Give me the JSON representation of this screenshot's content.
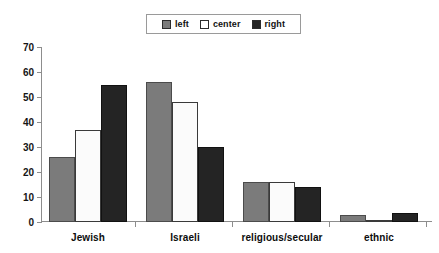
{
  "chart_data": {
    "type": "bar",
    "title": "",
    "xlabel": "",
    "ylabel": "",
    "ylim": [
      0,
      70
    ],
    "ytick_step": 10,
    "yticks": [
      0,
      10,
      20,
      30,
      40,
      50,
      60,
      70
    ],
    "grid": false,
    "legend_position": "top-center",
    "categories": [
      "Jewish",
      "Israeli",
      "religious/secular",
      "ethnic"
    ],
    "series": [
      {
        "name": "left",
        "color": "#7b7b7b",
        "values": [
          26,
          56,
          16,
          3
        ]
      },
      {
        "name": "center",
        "color": "#fbfbfb",
        "values": [
          37,
          48,
          16,
          1
        ]
      },
      {
        "name": "right",
        "color": "#242424",
        "values": [
          55,
          30,
          14,
          3.5
        ]
      }
    ]
  },
  "legend": {
    "items": [
      {
        "label": "left",
        "swatch": "legend-swatch-left"
      },
      {
        "label": "center",
        "swatch": "legend-swatch-center"
      },
      {
        "label": "right",
        "swatch": "legend-swatch-right"
      }
    ]
  },
  "axis": {
    "y_labels": [
      "70",
      "60",
      "50",
      "40",
      "30",
      "20",
      "10",
      "0"
    ]
  },
  "colors": {
    "series_left": "#7b7b7b",
    "series_center": "#fbfbfb",
    "series_right": "#242424",
    "axis": "#8d8d8d",
    "text": "#111111",
    "background": "#ffffff"
  }
}
